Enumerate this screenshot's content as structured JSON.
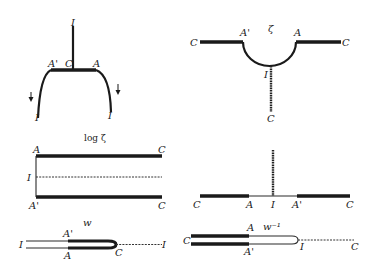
{
  "figure": {
    "panels": [
      {
        "id": "top-left",
        "description": "Strip bent downward: horizontal bold segment A' C A with vertical stem to I above, arcs down to I at both ends with downward arrows",
        "labels": {
          "top": "I",
          "left_top": "A'",
          "center": "C",
          "right_top": "A",
          "left_bottom": "I",
          "right_bottom": "I"
        }
      },
      {
        "id": "top-right",
        "title": "ζ",
        "description": "Semicircular notch between A' and A; horizontal bold rays to C on both sides; vertical stem from I down to C",
        "labels": {
          "left": "C",
          "left_corner": "A'",
          "right_corner": "A",
          "right": "C",
          "bottom_arc": "I",
          "bottom": "C"
        }
      },
      {
        "id": "middle-left",
        "title": "log ζ",
        "description": "Half-strip: top bold line A to C, bottom bold line A' to C, dashed center line from I",
        "labels": {
          "top_left": "A",
          "top_right": "C",
          "mid_left": "I",
          "bottom_left": "A'",
          "bottom_right": "C"
        }
      },
      {
        "id": "middle-right",
        "description": "Real axis with bold segments C–A and A'–C, thin segment A–A' through I, vertical dashed stem above I",
        "labels": {
          "far_left": "C",
          "left_inner": "A",
          "center": "I",
          "right_inner": "A'",
          "far_right": "C"
        }
      },
      {
        "id": "bottom-left",
        "title": "w",
        "description": "Slit domain: thin double line from I, bold from A'/A to rounded end at C, dashed line to I",
        "labels": {
          "left": "I",
          "top_mid": "A'",
          "bottom_mid": "A",
          "tip": "C",
          "right": "I"
        }
      },
      {
        "id": "bottom-right",
        "title": "w⁻¹",
        "description": "Slit domain: bold double line from C to A/A', thin double line to rounded end at I, dashed line to C",
        "labels": {
          "left": "C",
          "top_mid": "A",
          "bottom_mid": "A'",
          "tip": "I",
          "right": "C"
        }
      }
    ]
  }
}
